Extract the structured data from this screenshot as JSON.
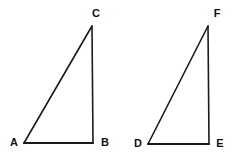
{
  "figure": {
    "background_color": "#ffffff",
    "stroke_color": "#1a1a1a",
    "label_color": "#111111",
    "stroke_width_hypotenuse": 1.6,
    "stroke_width_leg": 1.6,
    "stroke_width_base": 2.2,
    "width": 243,
    "height": 155,
    "shapes": [
      {
        "name": "triangle-abc",
        "vertices": [
          {
            "label": "A",
            "x": 24,
            "y": 143,
            "label_x": 14,
            "label_y": 142
          },
          {
            "label": "B",
            "x": 93,
            "y": 143,
            "label_x": 105,
            "label_y": 142
          },
          {
            "label": "C",
            "x": 92,
            "y": 26,
            "label_x": 96,
            "label_y": 13
          }
        ],
        "edges": [
          {
            "name": "edge-AB",
            "from": "A",
            "to": "B",
            "kind": "base"
          },
          {
            "name": "edge-BC",
            "from": "B",
            "to": "C",
            "kind": "leg"
          },
          {
            "name": "edge-CA",
            "from": "C",
            "to": "A",
            "kind": "hypotenuse"
          }
        ]
      },
      {
        "name": "triangle-def",
        "vertices": [
          {
            "label": "D",
            "x": 148,
            "y": 144,
            "label_x": 138,
            "label_y": 143
          },
          {
            "label": "E",
            "x": 209,
            "y": 144,
            "label_x": 220,
            "label_y": 143
          },
          {
            "label": "F",
            "x": 208,
            "y": 26,
            "label_x": 217,
            "label_y": 13
          }
        ],
        "edges": [
          {
            "name": "edge-DE",
            "from": "D",
            "to": "E",
            "kind": "base"
          },
          {
            "name": "edge-EF",
            "from": "E",
            "to": "F",
            "kind": "leg"
          },
          {
            "name": "edge-FD",
            "from": "F",
            "to": "D",
            "kind": "hypotenuse"
          }
        ]
      }
    ]
  }
}
